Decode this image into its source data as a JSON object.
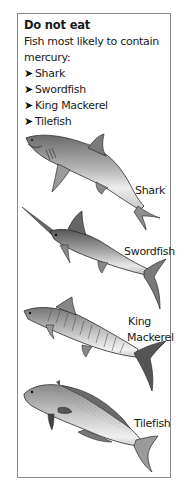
{
  "panel": {
    "title": "Do not eat",
    "intro": "Fish most likely to contain mercury:",
    "bullet_icon": "arrow-right-icon",
    "bullets": [
      {
        "label": "Shark"
      },
      {
        "label": "Swordfish"
      },
      {
        "label": "King Mackerel"
      },
      {
        "label": "Tilefish"
      }
    ]
  },
  "illustrations": [
    {
      "name": "shark",
      "label": "Shark"
    },
    {
      "name": "swordfish",
      "label": "Swordfish"
    },
    {
      "name": "king-mackerel",
      "label_line1": "King",
      "label_line2": "Mackerel"
    },
    {
      "name": "tilefish",
      "label": "Tilefish"
    }
  ],
  "colors": {
    "border": "#8a8a8a",
    "text": "#1a1a1a",
    "background": "#ffffff"
  }
}
